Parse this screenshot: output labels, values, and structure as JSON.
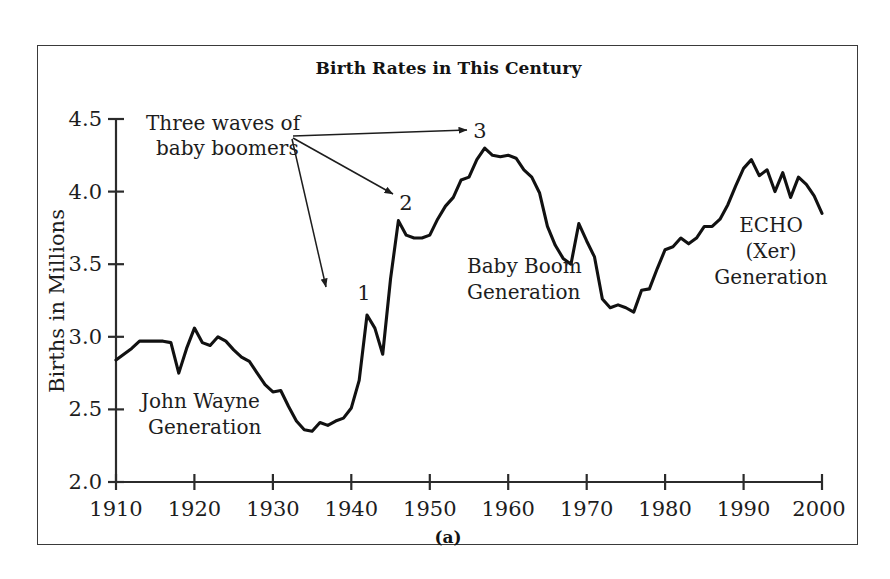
{
  "figure": {
    "title": "Birth Rates in This Century",
    "subcaption": "(a)"
  },
  "axes": {
    "y_label": "Births in Millions",
    "y_ticks": [
      "2.0",
      "2.5",
      "3.0",
      "3.5",
      "4.0",
      "4.5"
    ],
    "x_ticks": [
      "1910",
      "1920",
      "1930",
      "1940",
      "1950",
      "1960",
      "1970",
      "1980",
      "1990",
      "2000"
    ]
  },
  "annotations": {
    "waves_line1": "Three waves of",
    "waves_line2": "baby boomers",
    "wave_1": "1",
    "wave_2": "2",
    "wave_3": "3",
    "john_wayne_line1": "John Wayne",
    "john_wayne_line2": "Generation",
    "baby_boom_line1": "Baby Boom",
    "baby_boom_line2": "Generation",
    "echo_line1": "ECHO",
    "echo_line2": "(Xer)",
    "echo_line3": "Generation"
  },
  "colors": {
    "line": "#111111",
    "axis": "#2b2b2b",
    "frame": "#3a3a3a",
    "background": "#ffffff",
    "text": "#1d1d1d"
  },
  "chart_data": {
    "type": "line",
    "title": "Birth Rates in This Century",
    "xlabel": "",
    "ylabel": "Births in Millions",
    "xlim": [
      1910,
      2000
    ],
    "ylim": [
      2.0,
      4.5
    ],
    "ytick_step": 0.5,
    "xtick_step": 10,
    "grid": false,
    "legend": "none",
    "series": [
      {
        "name": "Births in Millions",
        "x": [
          1910,
          1911,
          1912,
          1913,
          1914,
          1915,
          1916,
          1917,
          1918,
          1919,
          1920,
          1921,
          1922,
          1923,
          1924,
          1925,
          1926,
          1927,
          1928,
          1929,
          1930,
          1931,
          1932,
          1933,
          1934,
          1935,
          1936,
          1937,
          1938,
          1939,
          1940,
          1941,
          1942,
          1943,
          1944,
          1945,
          1946,
          1947,
          1948,
          1949,
          1950,
          1951,
          1952,
          1953,
          1954,
          1955,
          1956,
          1957,
          1958,
          1959,
          1960,
          1961,
          1962,
          1963,
          1964,
          1965,
          1966,
          1967,
          1968,
          1969,
          1970,
          1971,
          1972,
          1973,
          1974,
          1975,
          1976,
          1977,
          1978,
          1979,
          1980,
          1981,
          1982,
          1983,
          1984,
          1985,
          1986,
          1987,
          1988,
          1989,
          1990,
          1991,
          1992,
          1993,
          1994,
          1995,
          1996,
          1997,
          1998,
          1999,
          2000
        ],
        "y": [
          2.84,
          2.88,
          2.92,
          2.97,
          2.97,
          2.97,
          2.97,
          2.96,
          2.75,
          2.92,
          3.06,
          2.96,
          2.94,
          3.0,
          2.97,
          2.91,
          2.86,
          2.83,
          2.75,
          2.67,
          2.62,
          2.63,
          2.52,
          2.42,
          2.36,
          2.35,
          2.41,
          2.39,
          2.42,
          2.44,
          2.51,
          2.7,
          3.15,
          3.06,
          2.88,
          3.4,
          3.8,
          3.7,
          3.68,
          3.68,
          3.7,
          3.81,
          3.9,
          3.96,
          4.08,
          4.1,
          4.22,
          4.3,
          4.25,
          4.24,
          4.25,
          4.23,
          4.15,
          4.1,
          3.99,
          3.76,
          3.63,
          3.54,
          3.5,
          3.78,
          3.66,
          3.55,
          3.26,
          3.2,
          3.22,
          3.2,
          3.17,
          3.32,
          3.33,
          3.47,
          3.6,
          3.62,
          3.68,
          3.64,
          3.68,
          3.76,
          3.76,
          3.81,
          3.91,
          4.04,
          4.16,
          4.22,
          4.11,
          4.15,
          4.0,
          4.13,
          3.96,
          4.1,
          4.05,
          3.97,
          3.85
        ]
      }
    ],
    "annotations": [
      {
        "label": "Three waves of baby boomers",
        "type": "callout",
        "targets": [
          "1",
          "2",
          "3"
        ]
      },
      {
        "label": "1",
        "x": 1942,
        "y": 3.15,
        "note": "first wave peak"
      },
      {
        "label": "2",
        "x": 1946,
        "y": 3.8,
        "note": "second wave peak"
      },
      {
        "label": "3",
        "x": 1957,
        "y": 4.3,
        "note": "third wave peak"
      },
      {
        "label": "John Wayne Generation",
        "x_range": [
          1910,
          1940
        ]
      },
      {
        "label": "Baby Boom Generation",
        "x_range": [
          1946,
          1964
        ]
      },
      {
        "label": "ECHO (Xer) Generation",
        "x_range": [
          1977,
          2000
        ]
      }
    ]
  }
}
